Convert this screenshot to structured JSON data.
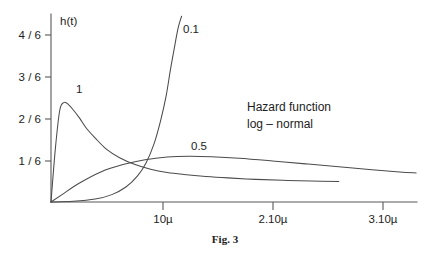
{
  "figure": {
    "caption": "Fig. 3",
    "annotation": {
      "line1": "Hazard function",
      "line2": "log – normal"
    }
  },
  "chart_data": {
    "type": "line",
    "title": "Hazard function log – normal",
    "xlabel": "",
    "ylabel": "h(t)",
    "grid": false,
    "legend_position": "inline-curve-labels",
    "xtick_labels": [
      "10µ",
      "2.10µ",
      "3.10µ"
    ],
    "xtick_values": [
      1,
      2,
      3
    ],
    "ytick_labels": [
      "1 / 6",
      "2 / 6",
      "3 / 6",
      "4 / 6"
    ],
    "ytick_values": [
      0.16667,
      0.33333,
      0.5,
      0.66667
    ],
    "xlim": [
      0,
      3.35
    ],
    "ylim": [
      0,
      0.75
    ],
    "series": [
      {
        "name": "1",
        "label": "1",
        "x": [
          0.0,
          0.04,
          0.08,
          0.12,
          0.16,
          0.2,
          0.26,
          0.32,
          0.4,
          0.5,
          0.62,
          0.76,
          0.9,
          1.05,
          1.2,
          1.4,
          1.6,
          1.85,
          2.1,
          2.35,
          2.6
        ],
        "y": [
          0.0,
          0.22,
          0.375,
          0.405,
          0.395,
          0.375,
          0.34,
          0.3,
          0.26,
          0.215,
          0.18,
          0.152,
          0.133,
          0.12,
          0.112,
          0.104,
          0.098,
          0.092,
          0.088,
          0.085,
          0.083
        ]
      },
      {
        "name": "0.1",
        "label": "0.1",
        "x": [
          0.0,
          0.2,
          0.4,
          0.55,
          0.68,
          0.78,
          0.86,
          0.93,
          0.99,
          1.04,
          1.08,
          1.12,
          1.15,
          1.18
        ],
        "y": [
          0.0,
          0.003,
          0.012,
          0.03,
          0.062,
          0.105,
          0.16,
          0.235,
          0.33,
          0.43,
          0.54,
          0.64,
          0.71,
          0.755
        ]
      },
      {
        "name": "0.5",
        "label": "0.5",
        "x": [
          0.0,
          0.1,
          0.25,
          0.45,
          0.65,
          0.85,
          1.05,
          1.25,
          1.45,
          1.7,
          2.0,
          2.3,
          2.6,
          2.9,
          3.15,
          3.3
        ],
        "y": [
          0.0,
          0.03,
          0.075,
          0.122,
          0.152,
          0.172,
          0.183,
          0.186,
          0.184,
          0.178,
          0.167,
          0.155,
          0.143,
          0.131,
          0.122,
          0.118
        ]
      }
    ]
  }
}
